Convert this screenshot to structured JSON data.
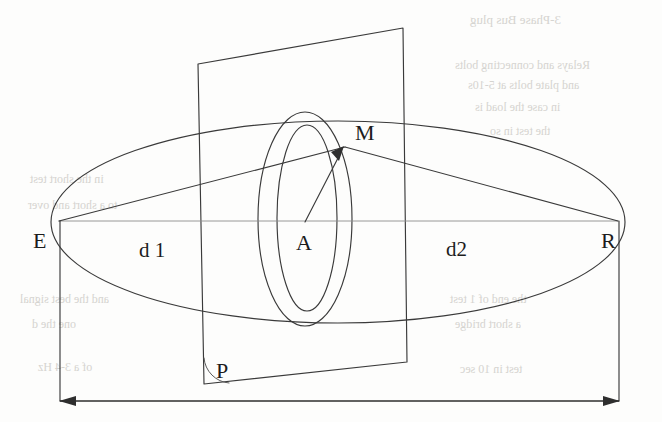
{
  "figure": {
    "type": "geometry-diagram",
    "background_color": "#fdfdfc",
    "line_color": "#3a3a3a",
    "labels": {
      "emitter": "E",
      "receiver": "R",
      "reflection_point": "M",
      "center": "A",
      "plane": "P",
      "distance_left": "d 1",
      "distance_right": "d2"
    },
    "label_positions": {
      "emitter": {
        "x": 42,
        "y": 245
      },
      "receiver": {
        "x": 601,
        "y": 245
      },
      "reflection_point": {
        "x": 355,
        "y": 139
      },
      "center": {
        "x": 297,
        "y": 248
      },
      "plane": {
        "x": 219,
        "y": 379
      },
      "distance_left": {
        "x": 140,
        "y": 258
      },
      "distance_right": {
        "x": 447,
        "y": 257
      }
    },
    "geometry": {
      "outer_ellipse": {
        "cx": 338,
        "cy": 222,
        "rx": 287,
        "ry": 101
      },
      "plane_quad": "198,64 403,28 407,362 204,384",
      "focal_ellipse_outer": {
        "cx": 305,
        "cy": 219,
        "rx": 47,
        "ry": 107
      },
      "focal_ellipse_inner": {
        "cx": 307,
        "cy": 218,
        "rx": 30,
        "ry": 93
      },
      "axis_line": {
        "x1": 59,
        "y1": 221,
        "x2": 618,
        "y2": 221
      },
      "ray_e_to_m": {
        "x1": 59,
        "y1": 221,
        "x2": 343,
        "y2": 148
      },
      "ray_m_to_r": {
        "x1": 343,
        "y1": 148,
        "x2": 618,
        "y2": 221
      },
      "arrow_a_to_m": {
        "x1": 305,
        "y1": 222,
        "x2": 343,
        "y2": 149
      },
      "dim_line_y": 401,
      "dim_left_x": 60,
      "dim_right_x": 619
    }
  },
  "bleed_through": [
    {
      "text": "3-Phase Bus plug",
      "x": 470,
      "y": 20,
      "size": 13
    },
    {
      "text": "Relays and connecting bolts",
      "x": 455,
      "y": 66,
      "size": 12
    },
    {
      "text": "and plate bolts at 5-10s",
      "x": 468,
      "y": 86,
      "size": 12
    },
    {
      "text": "in case the load is",
      "x": 475,
      "y": 108,
      "size": 12
    },
    {
      "text": "the test in so",
      "x": 490,
      "y": 132,
      "size": 12
    },
    {
      "text": "in the short test",
      "x": 30,
      "y": 180,
      "size": 12
    },
    {
      "text": "to a short and over",
      "x": 28,
      "y": 206,
      "size": 12
    },
    {
      "text": "and the best signal",
      "x": 20,
      "y": 300,
      "size": 12
    },
    {
      "text": "one the d",
      "x": 32,
      "y": 325,
      "size": 12
    },
    {
      "text": "of a 3-4 Hz",
      "x": 38,
      "y": 368,
      "size": 12
    },
    {
      "text": "the end of 1 test",
      "x": 450,
      "y": 300,
      "size": 12
    },
    {
      "text": "a short bridge",
      "x": 455,
      "y": 325,
      "size": 12
    },
    {
      "text": "test in 10 sec",
      "x": 460,
      "y": 370,
      "size": 12
    }
  ]
}
